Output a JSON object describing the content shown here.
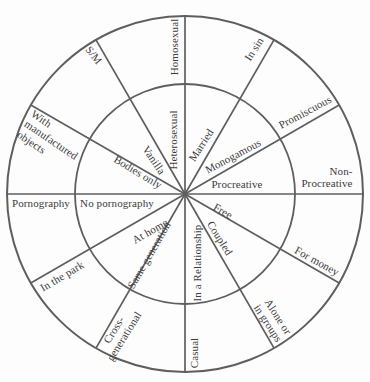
{
  "diagram": {
    "style": {
      "line_color": "#5e5e5e",
      "text_color": "#3c3c3c",
      "background": "#fdfdfd"
    },
    "sectors": [
      {
        "spoke_angle_deg": 0,
        "inner": "Heterosexual",
        "outer": "Homosexual"
      },
      {
        "spoke_angle_deg": 30,
        "inner": "Married",
        "outer": "In sin"
      },
      {
        "spoke_angle_deg": 60,
        "inner": "Monogamous",
        "outer": "Promiscuous"
      },
      {
        "spoke_angle_deg": 90,
        "inner": "Procreative",
        "outer": "Non-\nProcreative"
      },
      {
        "spoke_angle_deg": 120,
        "inner": "Free",
        "outer": "For money"
      },
      {
        "spoke_angle_deg": 150,
        "inner": "Coupled",
        "outer": "Alone or\nin groups"
      },
      {
        "spoke_angle_deg": 180,
        "inner": "In a Relationship",
        "outer": "Casual"
      },
      {
        "spoke_angle_deg": 210,
        "inner": "Same generation",
        "outer": "Cross-\ngenerational"
      },
      {
        "spoke_angle_deg": 240,
        "inner": "At home",
        "outer": "In the park"
      },
      {
        "spoke_angle_deg": 270,
        "inner": "No pornography",
        "outer": "Pornography"
      },
      {
        "spoke_angle_deg": 300,
        "inner": "Bodies only",
        "outer": "With\nmanufactured\nobjects"
      },
      {
        "spoke_angle_deg": 330,
        "inner": "Vanilla",
        "outer": "S/M"
      }
    ]
  }
}
